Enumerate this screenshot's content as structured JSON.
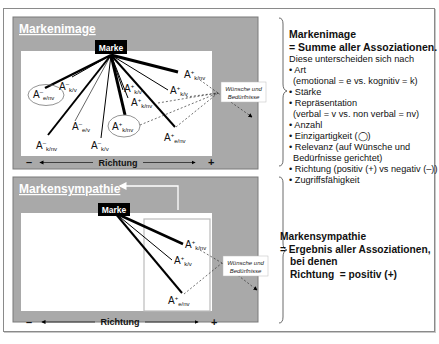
{
  "top_panel": {
    "title": "Markenimage",
    "marke_label": "Marke",
    "needs_label_line1": "Wünsche und",
    "needs_label_line2": "Bedürfnisse",
    "axis_minus": "–",
    "axis_plus": "+",
    "axis_label": "Richtung",
    "associations": [
      {
        "base": "A",
        "sign": "–",
        "sub": "e/nv",
        "circled": true
      },
      {
        "base": "A",
        "sign": "–",
        "sub": "k/v",
        "circled": false
      },
      {
        "base": "A",
        "sign": "–",
        "sub": "e/v",
        "circled": false
      },
      {
        "base": "A",
        "sign": "–",
        "sub": "k/nv",
        "circled": false
      },
      {
        "base": "A",
        "sign": "–",
        "sub": "k/v",
        "circled": false
      },
      {
        "base": "A",
        "sign": "+",
        "sub": "k/v",
        "circled": false
      },
      {
        "base": "A",
        "sign": "+",
        "sub": "k/nv",
        "circled": false
      },
      {
        "base": "A",
        "sign": "+",
        "sub": "k/nv",
        "circled": true
      },
      {
        "base": "A",
        "sign": "+",
        "sub": "k/v",
        "circled": false
      },
      {
        "base": "A",
        "sign": "+",
        "sub": "k/nv",
        "circled": false
      },
      {
        "base": "A",
        "sign": "+",
        "sub": "e/nv",
        "circled": false
      }
    ]
  },
  "top_description": {
    "title_line1": "Markenimage",
    "title_line2": "= Summe aller Assoziationen.",
    "intro": "Diese unterscheiden sich nach",
    "items": [
      "• Art",
      "  (emotional = e vs. kognitiv = k)",
      "• Stärke",
      "• Repräsentation",
      "  (verbal = v vs. non verbal = nv)",
      "• Anzahl",
      "• Einzigartigkeit (◯)",
      "• Relevanz (auf Wünsche und",
      "  Bedürfnisse gerichtet)",
      "• Richtung (positiv (+) vs negativ (–))",
      "• Zugriffsfähigkeit"
    ]
  },
  "bottom_panel": {
    "title": "Markensympathie",
    "marke_label": "Marke",
    "needs_label_line1": "Wünsche und",
    "needs_label_line2": "Bedürfnisse",
    "axis_minus": "–",
    "axis_plus": "+",
    "axis_label": "Richtung",
    "associations": [
      {
        "base": "A",
        "sign": "+",
        "sub": "k/nv"
      },
      {
        "base": "A",
        "sign": "+",
        "sub": "k/v"
      },
      {
        "base": "A",
        "sign": "+",
        "sub": "e/nv"
      }
    ]
  },
  "bottom_description": {
    "line1": "Markensympathie",
    "line2": "= Ergebnis aller Assoziationen,",
    "line3": "bei denen",
    "line4": "Richtung  = positiv (+)"
  },
  "colors": {
    "panel_gray": "#a9a9a9",
    "panel_border": "#7a7a7a",
    "canvas_white": "#ffffff",
    "marke_bg": "#000000",
    "line": "#000000"
  }
}
